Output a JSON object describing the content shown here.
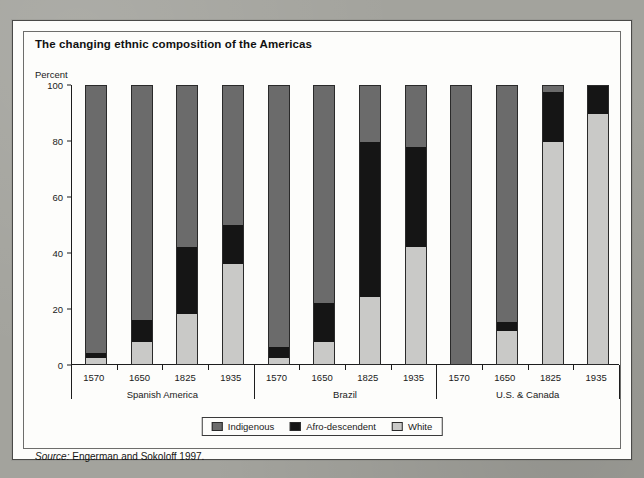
{
  "figure": {
    "title": "The changing ethnic composition of the Americas",
    "source_prefix": "Source:",
    "source_text": "Engerman and Sokoloff 1997."
  },
  "colors": {
    "indigenous": "#6b6b6b",
    "afro_descendent": "#151515",
    "white": "#c9c9c7",
    "axis": "#1d1d1d",
    "card_background": "#fdfdfb",
    "page_background": "#a3a39d"
  },
  "chart_data": {
    "type": "bar",
    "stacked": true,
    "title": "The changing ethnic composition of the Americas",
    "xlabel": "",
    "ylabel": "Percent",
    "ylim": [
      0,
      100
    ],
    "yticks": [
      0,
      20,
      40,
      60,
      80,
      100
    ],
    "ytick_labels": [
      "0",
      "20",
      "40",
      "60",
      "80",
      "100"
    ],
    "grid": false,
    "legend_position": "bottom-center",
    "legend": [
      "Indigenous",
      "Afro-descendent",
      "White"
    ],
    "stack_order_bottom_to_top": [
      "White",
      "Afro-descendent",
      "Indigenous"
    ],
    "groups": [
      "Spanish America",
      "Brazil",
      "U.S. & Canada"
    ],
    "categories": [
      "1570",
      "1650",
      "1825",
      "1935"
    ],
    "series": [
      {
        "name": "White",
        "values": {
          "Spanish America": [
            2,
            8,
            18,
            36
          ],
          "Brazil": [
            2,
            8,
            24,
            42
          ],
          "U.S. & Canada": [
            0,
            12,
            80,
            90
          ]
        }
      },
      {
        "name": "Afro-descendent",
        "values": {
          "Spanish America": [
            2,
            8,
            24,
            14
          ],
          "Brazil": [
            4,
            14,
            56,
            36
          ],
          "U.S. & Canada": [
            0,
            3,
            18,
            10
          ]
        }
      },
      {
        "name": "Indigenous",
        "values": {
          "Spanish America": [
            96,
            84,
            58,
            50
          ],
          "Brazil": [
            94,
            78,
            20,
            22
          ],
          "U.S. & Canada": [
            100,
            85,
            2,
            0
          ]
        }
      }
    ],
    "bars": [
      {
        "group": "Spanish America",
        "year": "1570",
        "white": 2,
        "afro": 2,
        "indigenous": 96
      },
      {
        "group": "Spanish America",
        "year": "1650",
        "white": 8,
        "afro": 8,
        "indigenous": 84
      },
      {
        "group": "Spanish America",
        "year": "1825",
        "white": 18,
        "afro": 24,
        "indigenous": 58
      },
      {
        "group": "Spanish America",
        "year": "1935",
        "white": 36,
        "afro": 14,
        "indigenous": 50
      },
      {
        "group": "Brazil",
        "year": "1570",
        "white": 2,
        "afro": 4,
        "indigenous": 94
      },
      {
        "group": "Brazil",
        "year": "1650",
        "white": 8,
        "afro": 14,
        "indigenous": 78
      },
      {
        "group": "Brazil",
        "year": "1825",
        "white": 24,
        "afro": 56,
        "indigenous": 20
      },
      {
        "group": "Brazil",
        "year": "1935",
        "white": 42,
        "afro": 36,
        "indigenous": 22
      },
      {
        "group": "U.S. & Canada",
        "year": "1570",
        "white": 0,
        "afro": 0,
        "indigenous": 100
      },
      {
        "group": "U.S. & Canada",
        "year": "1650",
        "white": 12,
        "afro": 3,
        "indigenous": 85
      },
      {
        "group": "U.S. & Canada",
        "year": "1825",
        "white": 80,
        "afro": 18,
        "indigenous": 2
      },
      {
        "group": "U.S. & Canada",
        "year": "1935",
        "white": 90,
        "afro": 10,
        "indigenous": 0
      }
    ]
  }
}
